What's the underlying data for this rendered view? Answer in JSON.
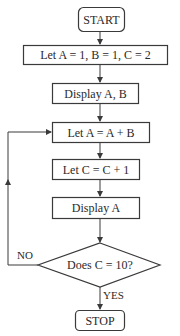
{
  "flowchart": {
    "start": {
      "label": "START"
    },
    "steps": [
      {
        "id": "init",
        "label": "Let A = 1, B = 1, C = 2"
      },
      {
        "id": "display_ab",
        "label": "Display A, B"
      },
      {
        "id": "update_a",
        "label": "Let A = A + B"
      },
      {
        "id": "increment_c",
        "label": "Let C = C + 1"
      },
      {
        "id": "display_a",
        "label": "Display A"
      }
    ],
    "decision": {
      "label": "Does C = 10?",
      "no_label": "NO",
      "yes_label": "YES"
    },
    "stop": {
      "label": "STOP"
    }
  },
  "colors": {
    "stroke": "#3a3a3a",
    "background": "#ffffff"
  }
}
